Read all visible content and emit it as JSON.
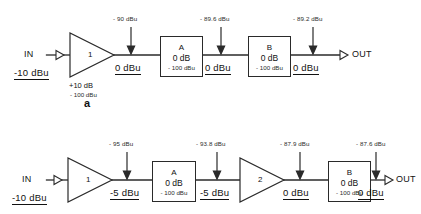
{
  "figure": {
    "unit": "dBu"
  },
  "diagram_a": {
    "label": "a",
    "input": {
      "port": "IN",
      "level": "-10 dBu"
    },
    "output": {
      "port": "OUT",
      "level": "0 dBu"
    },
    "amp1": {
      "number": "1",
      "gain": "+10 dB",
      "noise": "- 100 dBu"
    },
    "noise_after_amp1": "- 90 dBu",
    "level_after_amp1": "0 dBu",
    "blockA": {
      "name": "A",
      "gain": "0 dB",
      "noise": "- 100 dBu"
    },
    "noise_after_A": "- 89.6 dBu",
    "level_after_A": "0 dBu",
    "blockB": {
      "name": "B",
      "gain": "0 dB",
      "noise": "- 100 dBu"
    },
    "noise_after_B": "- 89.2 dBu"
  },
  "diagram_b": {
    "input": {
      "port": "IN",
      "level": "-10 dBu"
    },
    "output": {
      "port": "OUT",
      "level": "0 dBu"
    },
    "amp1": {
      "number": "1"
    },
    "noise_after_amp1": "- 95 dBu",
    "level_after_amp1": "-5 dBu",
    "blockA": {
      "name": "A",
      "gain": "0 dB",
      "noise": "- 100 dBu"
    },
    "noise_after_A": "- 93.8 dBu",
    "level_after_A": "-5 dBu",
    "amp2": {
      "number": "2"
    },
    "noise_after_amp2": "- 87.9 dBu",
    "level_after_amp2": "0 dBu",
    "blockB": {
      "name": "B",
      "gain": "0 dB",
      "noise": "- 100 dBu"
    },
    "noise_after_B": "- 87.6 dBu"
  }
}
